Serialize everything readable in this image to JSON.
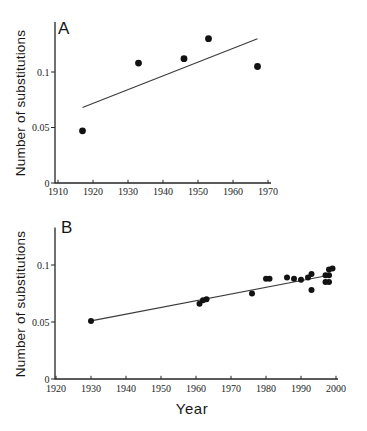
{
  "figure": {
    "background": "#ffffff",
    "colors": {
      "ink": "#262626",
      "marker": "#121212",
      "trend_line": "#3a3a3a",
      "text": "#1c1c1c"
    }
  },
  "chart_data": [
    {
      "type": "scatter",
      "panel": "A",
      "title": "",
      "xlabel": "",
      "ylabel": "Number of substitutions",
      "xlim": [
        1910,
        1970
      ],
      "ylim": [
        0,
        0.145
      ],
      "xticks": [
        1910,
        1920,
        1930,
        1940,
        1950,
        1960,
        1970
      ],
      "ytick_values": [
        0,
        0.05,
        0.1
      ],
      "ytick_labels": [
        "0",
        "0.05",
        "0.1"
      ],
      "grid": false,
      "legend": null,
      "points": [
        [
          1917,
          0.047
        ],
        [
          1933,
          0.108
        ],
        [
          1946,
          0.112
        ],
        [
          1953,
          0.13
        ],
        [
          1967,
          0.105
        ]
      ],
      "trend_line": {
        "x": [
          1917,
          1967
        ],
        "y": [
          0.068,
          0.13
        ]
      }
    },
    {
      "type": "scatter",
      "panel": "B",
      "title": "",
      "xlabel": "Year",
      "ylabel": "Number of substitutions",
      "xlim": [
        1920,
        2000
      ],
      "ylim": [
        0,
        0.133
      ],
      "xticks": [
        1920,
        1930,
        1940,
        1950,
        1960,
        1970,
        1980,
        1990,
        2000
      ],
      "ytick_values": [
        0,
        0.05,
        0.1
      ],
      "ytick_labels": [
        "0",
        "0.05",
        "0.1"
      ],
      "grid": false,
      "legend": null,
      "points": [
        [
          1930,
          0.051
        ],
        [
          1961,
          0.066
        ],
        [
          1962,
          0.069
        ],
        [
          1963,
          0.07
        ],
        [
          1976,
          0.075
        ],
        [
          1980,
          0.088
        ],
        [
          1981,
          0.088
        ],
        [
          1986,
          0.089
        ],
        [
          1988,
          0.088
        ],
        [
          1990,
          0.087
        ],
        [
          1992,
          0.089
        ],
        [
          1993,
          0.092
        ],
        [
          1993,
          0.078
        ],
        [
          1997,
          0.085
        ],
        [
          1998,
          0.085
        ],
        [
          1997,
          0.091
        ],
        [
          1998,
          0.091
        ],
        [
          1998,
          0.096
        ],
        [
          1999,
          0.097
        ]
      ],
      "trend_line": {
        "x": [
          1930,
          1998
        ],
        "y": [
          0.051,
          0.091
        ]
      }
    }
  ]
}
